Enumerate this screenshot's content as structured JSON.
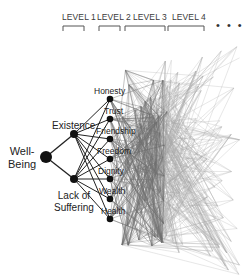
{
  "header": {
    "levels": [
      {
        "label": "LEVEL 1",
        "x": 62,
        "bracket": [
          63,
          84
        ]
      },
      {
        "label": "LEVEL 2",
        "x": 97,
        "bracket": [
          99,
          120
        ]
      },
      {
        "label": "LEVEL 3",
        "x": 133,
        "bracket": [
          125,
          165
        ]
      },
      {
        "label": "LEVEL 4",
        "x": 172,
        "bracket": [
          168,
          204
        ]
      }
    ],
    "ellipsis": "• • •"
  },
  "nodes": {
    "root": {
      "label_line1": "Well-",
      "label_line2": "Being",
      "x": 46,
      "y": 157,
      "r": 6
    },
    "level1": [
      {
        "label": "Existence",
        "x": 74,
        "y": 134
      },
      {
        "label_line1": "Lack of",
        "label_line2": "Suffering",
        "x": 74,
        "y": 179
      }
    ],
    "level2": [
      {
        "label": "Honesty",
        "x": 110,
        "y": 99
      },
      {
        "label": "Trust",
        "x": 110,
        "y": 119
      },
      {
        "label": "Friendship",
        "x": 110,
        "y": 139
      },
      {
        "label": "Freedom",
        "x": 110,
        "y": 159
      },
      {
        "label": "Dignity",
        "x": 110,
        "y": 179
      },
      {
        "label": "Wealth",
        "x": 110,
        "y": 199
      },
      {
        "label": "Health",
        "x": 110,
        "y": 219
      }
    ]
  },
  "colors": {
    "node": "#111111",
    "edge_core": "#222222",
    "edge_level3": "#6e6e6e",
    "edge_level4": "#a8a8a8",
    "bracket": "#555555"
  }
}
